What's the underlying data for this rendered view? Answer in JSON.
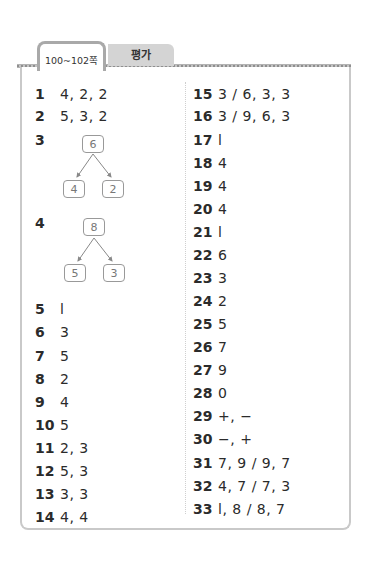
{
  "header": {
    "tabs": [
      {
        "label": "100~102쪽",
        "active": true
      },
      {
        "label": "평가",
        "active": false
      }
    ]
  },
  "left_column": [
    {
      "num": "1",
      "answer": "4, 2, 2"
    },
    {
      "num": "2",
      "answer": "5, 3, 2"
    },
    {
      "num": "3",
      "answer": "",
      "tree": {
        "top": "6",
        "left": "4",
        "right": "2"
      }
    },
    {
      "num": "4",
      "answer": "",
      "tree": {
        "top": "8",
        "left": "5",
        "right": "3"
      }
    },
    {
      "num": "5",
      "answer": "l"
    },
    {
      "num": "6",
      "answer": "3"
    },
    {
      "num": "7",
      "answer": "5"
    },
    {
      "num": "8",
      "answer": "2"
    },
    {
      "num": "9",
      "answer": "4"
    },
    {
      "num": "10",
      "answer": "5"
    },
    {
      "num": "11",
      "answer": "2, 3"
    },
    {
      "num": "12",
      "answer": "5, 3"
    },
    {
      "num": "13",
      "answer": "3, 3"
    },
    {
      "num": "14",
      "answer": "4, 4"
    }
  ],
  "right_column": [
    {
      "num": "15",
      "answer": "3 / 6, 3, 3"
    },
    {
      "num": "16",
      "answer": "3 / 9, 6, 3"
    },
    {
      "num": "17",
      "answer": "l"
    },
    {
      "num": "18",
      "answer": "4"
    },
    {
      "num": "19",
      "answer": "4"
    },
    {
      "num": "20",
      "answer": "4"
    },
    {
      "num": "21",
      "answer": "l"
    },
    {
      "num": "22",
      "answer": "6"
    },
    {
      "num": "23",
      "answer": "3"
    },
    {
      "num": "24",
      "answer": "2"
    },
    {
      "num": "25",
      "answer": "5"
    },
    {
      "num": "26",
      "answer": "7"
    },
    {
      "num": "27",
      "answer": "9"
    },
    {
      "num": "28",
      "answer": "0"
    },
    {
      "num": "29",
      "answer": "+, −"
    },
    {
      "num": "30",
      "answer": "−, +"
    },
    {
      "num": "31",
      "answer": "7, 9 / 9, 7"
    },
    {
      "num": "32",
      "answer": "4, 7 / 7, 3"
    },
    {
      "num": "33",
      "answer": "l, 8 / 8, 7"
    }
  ],
  "colors": {
    "frame_border": "#c9c9c9",
    "tab_inactive_bg": "#d4d4d4",
    "text": "#2b2b2b",
    "tree_box_border": "#999999"
  }
}
